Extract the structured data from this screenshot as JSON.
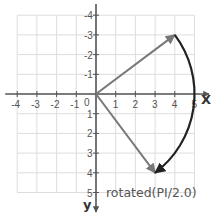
{
  "diagram": {
    "type": "vector-rotation-plot",
    "x_axis": {
      "label": "X",
      "range": [
        -4,
        5
      ],
      "ticks": [
        {
          "value": -4,
          "label": "-4"
        },
        {
          "value": -3,
          "label": "-3"
        },
        {
          "value": -2,
          "label": "-2"
        },
        {
          "value": -1,
          "label": "-1"
        },
        {
          "value": 1,
          "label": "1"
        },
        {
          "value": 2,
          "label": "2"
        },
        {
          "value": 3,
          "label": "3"
        },
        {
          "value": 4,
          "label": "4"
        },
        {
          "value": 5,
          "label": "5"
        }
      ]
    },
    "y_axis": {
      "label": "y",
      "direction": "down",
      "range": [
        -4,
        5
      ],
      "ticks": [
        {
          "value": -4,
          "label": "-4"
        },
        {
          "value": -3,
          "label": "-3"
        },
        {
          "value": -2,
          "label": "-2"
        },
        {
          "value": -1,
          "label": "-1"
        },
        {
          "value": 1,
          "label": "1"
        },
        {
          "value": 2,
          "label": "2"
        },
        {
          "value": 3,
          "label": "3"
        },
        {
          "value": 4,
          "label": "4"
        },
        {
          "value": 5,
          "label": "5"
        }
      ]
    },
    "origin_label": "0",
    "vectors": [
      {
        "name": "original",
        "from": [
          0,
          0
        ],
        "to": [
          4,
          -3
        ],
        "color": "#777777"
      },
      {
        "name": "rotated",
        "from": [
          0,
          0
        ],
        "to": [
          3,
          4
        ],
        "color": "#777777"
      }
    ],
    "rotation_arc": {
      "from": [
        4,
        -3
      ],
      "to": [
        3,
        4
      ],
      "radius": 5,
      "color": "#222222"
    },
    "caption": "rotated(PI/2.0)",
    "colors": {
      "grid": "#dddddd",
      "axis": "#555555",
      "vector": "#777777",
      "arc": "#222222"
    }
  }
}
